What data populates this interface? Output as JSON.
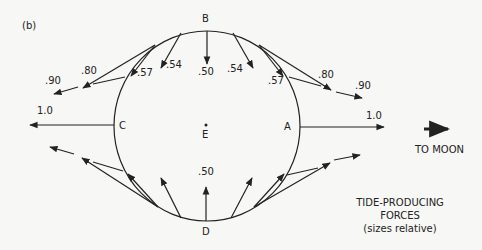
{
  "figure": {
    "panel_label": "(b)",
    "points": {
      "B": "B",
      "C": "C",
      "A": "A",
      "D": "D",
      "E": "E"
    },
    "to_moon": "TO MOON",
    "caption": {
      "line1": "TIDE-PRODUCING",
      "line2": "FORCES",
      "line3": "(sizes relative)"
    },
    "force_labels": {
      "top_center": ".50",
      "top_left_054": ".54",
      "top_left_057": ".57",
      "top_left_080": ".80",
      "top_left_090": ".90",
      "top_right_054": ".54",
      "top_right_057": ".57",
      "top_right_080": ".80",
      "top_right_090": ".90",
      "left_10": "1.0",
      "right_10": "1.0",
      "bottom_center": ".50"
    },
    "colors": {
      "ink": "#222222",
      "paper": "#f7f7f5"
    }
  }
}
